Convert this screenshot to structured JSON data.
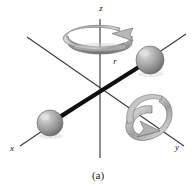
{
  "figure": {
    "caption": "(a)",
    "background_color": "#ffffff",
    "ink_color": "#1a1a1a"
  },
  "axes": {
    "z": {
      "label": "z",
      "label_x": 101,
      "label_y": 11
    },
    "x": {
      "label": "x",
      "label_x": 12,
      "label_y": 151
    },
    "y": {
      "label": "y",
      "label_x": 177,
      "label_y": 150
    }
  },
  "annotations": {
    "radius": {
      "label": "r",
      "label_x": 115,
      "label_y": 64
    }
  },
  "spheres": [
    {
      "name": "upper-right-mass",
      "cx": 150,
      "cy": 60,
      "r": 14,
      "fill": "#9a9a9a",
      "highlight": "#d6d6d6"
    },
    {
      "name": "lower-left-mass",
      "cx": 50,
      "cy": 123,
      "r": 13,
      "fill": "#9a9a9a",
      "highlight": "#d6d6d6"
    }
  ],
  "rod": {
    "name": "connecting-rod",
    "x1": 50,
    "y1": 123,
    "x2": 150,
    "y2": 60,
    "color": "#101010",
    "width": 4
  },
  "rotation_arrows": [
    {
      "name": "z-axis-rotation-arrow",
      "about": "z",
      "cx": 100,
      "cy": 36
    },
    {
      "name": "y-axis-rotation-arrow",
      "about": "y",
      "cx": 146,
      "cy": 116
    }
  ],
  "colors": {
    "sphere_gray": "#9a9a9a",
    "sphere_light": "#d6d6d6",
    "sphere_dark": "#6e6e6e",
    "band_gray": "#b4b4b4",
    "band_dark": "#7d7d7d",
    "axis_line": "#2b2b2b",
    "rod_black": "#101010"
  }
}
